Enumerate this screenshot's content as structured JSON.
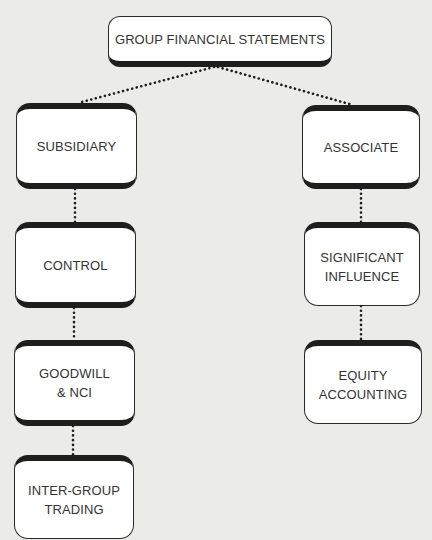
{
  "diagram": {
    "title": "GROUP FINANCIAL STATEMENTS",
    "colors": {
      "background": "#ebebea",
      "box_fill": "#ffffff",
      "box_border": "#1e1e1e",
      "text": "#333333",
      "connector": "#1e1e1e"
    },
    "nodes": {
      "root": {
        "label": "GROUP FINANCIAL STATEMENTS"
      },
      "subsidiary": {
        "label": "SUBSIDIARY"
      },
      "control": {
        "label": "CONTROL"
      },
      "goodwill_nci": {
        "label": "GOODWILL\n& NCI"
      },
      "inter_group_trading": {
        "label": "INTER-GROUP\nTRADING"
      },
      "associate": {
        "label": "ASSOCIATE"
      },
      "significant_influence": {
        "label": "SIGNIFICANT\nINFLUENCE"
      },
      "equity_accounting": {
        "label": "EQUITY\nACCOUNTING"
      }
    },
    "edges": [
      {
        "from": "GROUP FINANCIAL STATEMENTS",
        "to": "SUBSIDIARY",
        "style": "dotted"
      },
      {
        "from": "GROUP FINANCIAL STATEMENTS",
        "to": "ASSOCIATE",
        "style": "dotted"
      },
      {
        "from": "SUBSIDIARY",
        "to": "CONTROL",
        "style": "dotted"
      },
      {
        "from": "CONTROL",
        "to": "GOODWILL & NCI",
        "style": "dotted"
      },
      {
        "from": "GOODWILL & NCI",
        "to": "INTER-GROUP TRADING",
        "style": "dotted"
      },
      {
        "from": "ASSOCIATE",
        "to": "SIGNIFICANT INFLUENCE",
        "style": "dotted"
      },
      {
        "from": "SIGNIFICANT INFLUENCE",
        "to": "EQUITY ACCOUNTING",
        "style": "dotted"
      }
    ]
  }
}
